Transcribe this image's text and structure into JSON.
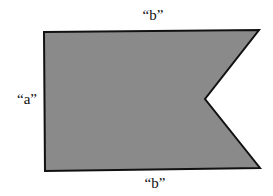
{
  "diagram": {
    "shape": "notched-flag",
    "fill_color": "#8a8a8a",
    "stroke_color": "#111111",
    "labels": {
      "top": "“b”",
      "left": "“a”",
      "bottom": "“b”"
    }
  }
}
